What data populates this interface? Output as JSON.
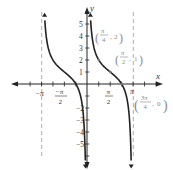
{
  "chart_data": {
    "type": "line",
    "title": "",
    "function": "y = cot(x) + 1",
    "xlabel": "x",
    "ylabel": "y",
    "xlim": [
      -4.2,
      4.0
    ],
    "ylim": [
      -6.5,
      6.5
    ],
    "grid": false,
    "x_ticks": [
      "-π",
      "-π/2",
      "π/2",
      "π"
    ],
    "y_ticks": [
      1,
      2,
      3,
      4,
      5,
      -2,
      -3,
      -4,
      -5
    ],
    "asymptotes": [
      {
        "x_label": "-π",
        "style": "dashed"
      },
      {
        "x_label": "π",
        "style": "dashed"
      }
    ],
    "series": [
      {
        "name": "branch (-π, 0)",
        "x_range": [
          "-π",
          "0"
        ]
      },
      {
        "name": "branch (0, π)",
        "x_range": [
          "0",
          "π"
        ]
      }
    ],
    "annotations": [
      {
        "label": "(π/4, 2)",
        "x": 0.785,
        "y": 2
      },
      {
        "label": "(π/2, 1)",
        "x": 1.571,
        "y": 1
      },
      {
        "label": "(3π/4, 0)",
        "x": 2.356,
        "y": 0
      }
    ]
  },
  "axes": {
    "x_label": "x",
    "y_label": "y"
  },
  "ticks": {
    "neg_pi": "−π",
    "neg_pi_half_num": "−π",
    "neg_pi_half_den": "2",
    "pi_half_num": "π",
    "pi_half_den": "2",
    "pi": "π",
    "y": [
      "5",
      "4",
      "3",
      "2",
      "1",
      "−2",
      "−3",
      "−4",
      "−5"
    ]
  },
  "points": {
    "p1": {
      "num": "π",
      "den": "4",
      "y": "2"
    },
    "p2": {
      "num": "π",
      "den": "2",
      "y": "1"
    },
    "p3": {
      "num": "3π",
      "den": "4",
      "y": "0"
    }
  }
}
